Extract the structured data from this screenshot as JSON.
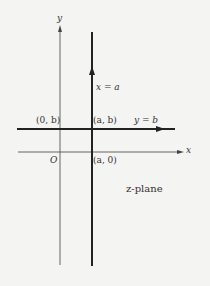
{
  "diagram": {
    "plane_label": "z-plane",
    "axes": {
      "x_label": "x",
      "y_label": "y",
      "origin_label": "O"
    },
    "lines": {
      "vertical": {
        "label": "x = a",
        "direction": "up"
      },
      "horizontal": {
        "label": "y = b",
        "direction": "right"
      }
    },
    "points": {
      "p0b": "(0, b)",
      "pab": "(a, b)",
      "pa0": "(a, 0)"
    },
    "colors": {
      "background": "#f4f4f2",
      "axis": "#555555",
      "thick_line": "#222222",
      "text": "#333333"
    }
  }
}
